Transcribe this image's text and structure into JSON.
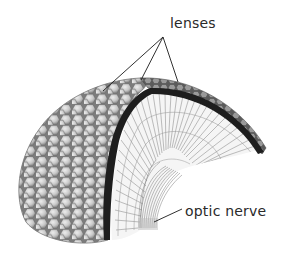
{
  "diagram": {
    "labels": {
      "lenses": "lenses",
      "optic_nerve": "optic nerve"
    },
    "colors": {
      "background": "#ffffff",
      "label_text": "#2a2a2a",
      "leader_lines": "#1a1a1a",
      "lens_surface": "#b8b8b8",
      "lens_highlight": "#e6e6e6",
      "lens_outline": "#6e6e6e",
      "cornea_band": "#1e1e1e",
      "ommatidia_fill": "#f4f4f4",
      "ommatidia_lines": "#8a8a8a",
      "nerve_fibers": "#7a7a7a"
    },
    "leader_lines": {
      "lenses": [
        {
          "from": [
            163,
            37
          ],
          "to": [
            103,
            91
          ]
        },
        {
          "from": [
            163,
            37
          ],
          "to": [
            141,
            80
          ]
        },
        {
          "from": [
            163,
            37
          ],
          "to": [
            178,
            82
          ]
        }
      ],
      "optic_nerve": [
        {
          "from": [
            154,
            222
          ],
          "to": [
            182,
            209
          ]
        }
      ]
    }
  }
}
